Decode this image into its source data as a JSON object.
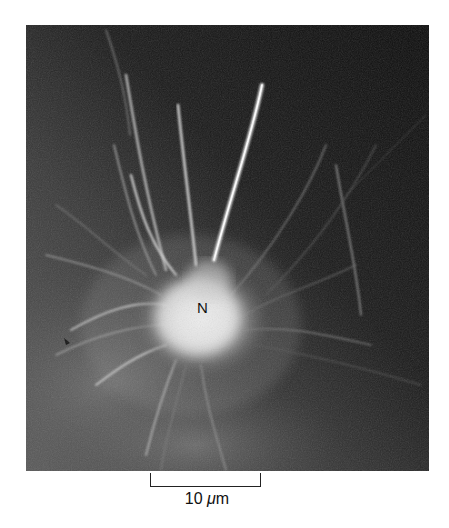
{
  "figure": {
    "type": "fluorescence micrograph",
    "colors": {
      "background_dark": "#0d0d0d",
      "background_mid": "#4a4a4a",
      "soma_bright": "#f2f2f2",
      "page": "#ffffff",
      "annotation": "#111111"
    },
    "labels": {
      "soma": "N"
    },
    "markers": [
      {
        "name": "arrowhead",
        "x": 68,
        "y": 341
      }
    ]
  },
  "scale_bar": {
    "value": "10",
    "unit": "μm",
    "unit_prefix": "μ",
    "unit_suffix": "m"
  }
}
